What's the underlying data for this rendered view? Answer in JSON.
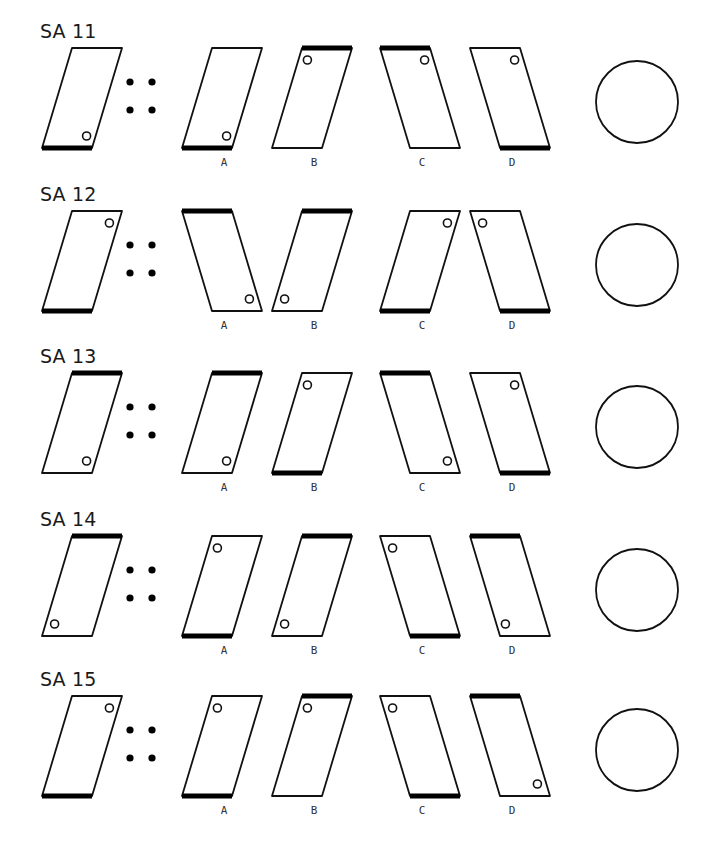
{
  "document": {
    "type": "figure-analogy test",
    "shape_legend": {
      "lean": "right = top edge shifted right; left = top edge shifted left",
      "thick": "edge drawn bold (top/bottom)",
      "dot": "position of small circle"
    },
    "option_labels": [
      "A",
      "B",
      "C",
      "D"
    ],
    "answer_circle": "empty circle (answer bubble)",
    "rows": [
      {
        "title": "SA 11",
        "question": {
          "lean": "right",
          "thick": "bottom",
          "dot": "bottom-right"
        },
        "options": [
          {
            "label": "A",
            "lean": "right",
            "thick": "bottom",
            "dot": "bottom-right"
          },
          {
            "label": "B",
            "lean": "right",
            "thick": "top",
            "dot": "top-left"
          },
          {
            "label": "C",
            "lean": "left",
            "thick": "top",
            "dot": "top-right"
          },
          {
            "label": "D",
            "lean": "left",
            "thick": "bottom",
            "dot": "top-right"
          }
        ]
      },
      {
        "title": "SA 12",
        "question": {
          "lean": "right",
          "thick": "bottom",
          "dot": "top-right"
        },
        "options": [
          {
            "label": "A",
            "lean": "left",
            "thick": "top",
            "dot": "bottom-right"
          },
          {
            "label": "B",
            "lean": "right",
            "thick": "top",
            "dot": "bottom-left"
          },
          {
            "label": "C",
            "lean": "right",
            "thick": "bottom",
            "dot": "top-right"
          },
          {
            "label": "D",
            "lean": "left",
            "thick": "bottom",
            "dot": "top-left"
          }
        ]
      },
      {
        "title": "SA 13",
        "question": {
          "lean": "right",
          "thick": "top",
          "dot": "bottom-right"
        },
        "options": [
          {
            "label": "A",
            "lean": "right",
            "thick": "top",
            "dot": "bottom-right"
          },
          {
            "label": "B",
            "lean": "right",
            "thick": "bottom",
            "dot": "top-left"
          },
          {
            "label": "C",
            "lean": "left",
            "thick": "top",
            "dot": "bottom-right"
          },
          {
            "label": "D",
            "lean": "left",
            "thick": "bottom",
            "dot": "top-right"
          }
        ]
      },
      {
        "title": "SA 14",
        "question": {
          "lean": "right",
          "thick": "top",
          "dot": "bottom-left"
        },
        "options": [
          {
            "label": "A",
            "lean": "right",
            "thick": "bottom",
            "dot": "top-left"
          },
          {
            "label": "B",
            "lean": "right",
            "thick": "top",
            "dot": "bottom-left"
          },
          {
            "label": "C",
            "lean": "left",
            "thick": "bottom",
            "dot": "top-left"
          },
          {
            "label": "D",
            "lean": "left",
            "thick": "top",
            "dot": "bottom-left"
          }
        ]
      },
      {
        "title": "SA 15",
        "question": {
          "lean": "right",
          "thick": "bottom",
          "dot": "top-right"
        },
        "options": [
          {
            "label": "A",
            "lean": "right",
            "thick": "bottom",
            "dot": "top-left"
          },
          {
            "label": "B",
            "lean": "right",
            "thick": "top",
            "dot": "top-left"
          },
          {
            "label": "C",
            "lean": "left",
            "thick": "bottom",
            "dot": "top-left"
          },
          {
            "label": "D",
            "lean": "left",
            "thick": "top",
            "dot": "bottom-right"
          }
        ]
      }
    ]
  }
}
